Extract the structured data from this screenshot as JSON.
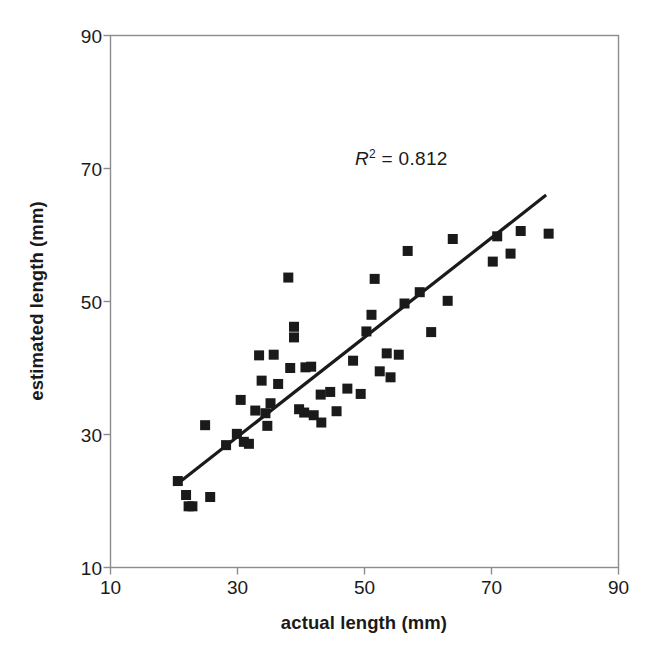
{
  "chart_data": {
    "type": "scatter",
    "title": "",
    "xlabel": "actual length (mm)",
    "ylabel": "estimated length (mm)",
    "xlim": [
      10,
      90
    ],
    "ylim": [
      10,
      90
    ],
    "xticks": [
      10,
      30,
      50,
      70,
      90
    ],
    "yticks": [
      10,
      30,
      50,
      70,
      90
    ],
    "grid": false,
    "legend": null,
    "annotations": [
      {
        "name": "r-squared",
        "text": "R2 = 0.812",
        "r_symbol": "R",
        "exponent": "2",
        "equals": " = ",
        "value": "0.812",
        "x": 50,
        "y": 69
      }
    ],
    "marker": {
      "shape": "square",
      "color": "#1a1a1a",
      "size_px": 10
    },
    "trendline": {
      "name": "linear-regression-line",
      "color": "#1a1a1a",
      "width_px": 3.2,
      "x_start": 20.7,
      "y_start": 22.7,
      "x_end": 78.6,
      "y_end": 66.0
    },
    "points": [
      {
        "x": 20.6,
        "y": 23.0
      },
      {
        "x": 21.9,
        "y": 20.9
      },
      {
        "x": 22.3,
        "y": 19.2
      },
      {
        "x": 22.9,
        "y": 19.2
      },
      {
        "x": 25.7,
        "y": 20.6
      },
      {
        "x": 24.9,
        "y": 31.4
      },
      {
        "x": 28.2,
        "y": 28.4
      },
      {
        "x": 29.9,
        "y": 30.1
      },
      {
        "x": 31.0,
        "y": 28.9
      },
      {
        "x": 31.8,
        "y": 28.6
      },
      {
        "x": 30.5,
        "y": 35.2
      },
      {
        "x": 32.8,
        "y": 33.6
      },
      {
        "x": 33.8,
        "y": 38.1
      },
      {
        "x": 34.7,
        "y": 31.3
      },
      {
        "x": 34.4,
        "y": 33.2
      },
      {
        "x": 35.2,
        "y": 34.7
      },
      {
        "x": 35.7,
        "y": 42.0
      },
      {
        "x": 36.4,
        "y": 37.6
      },
      {
        "x": 33.4,
        "y": 41.9
      },
      {
        "x": 38.0,
        "y": 53.6
      },
      {
        "x": 38.9,
        "y": 46.2
      },
      {
        "x": 38.9,
        "y": 44.6
      },
      {
        "x": 38.3,
        "y": 40.0
      },
      {
        "x": 39.7,
        "y": 33.8
      },
      {
        "x": 40.5,
        "y": 33.3
      },
      {
        "x": 40.7,
        "y": 40.1
      },
      {
        "x": 41.6,
        "y": 40.2
      },
      {
        "x": 42.0,
        "y": 32.9
      },
      {
        "x": 43.2,
        "y": 31.8
      },
      {
        "x": 43.1,
        "y": 36.0
      },
      {
        "x": 44.6,
        "y": 36.4
      },
      {
        "x": 45.6,
        "y": 33.5
      },
      {
        "x": 47.3,
        "y": 36.9
      },
      {
        "x": 48.2,
        "y": 41.1
      },
      {
        "x": 49.4,
        "y": 36.1
      },
      {
        "x": 50.3,
        "y": 45.5
      },
      {
        "x": 51.1,
        "y": 48.0
      },
      {
        "x": 51.6,
        "y": 53.4
      },
      {
        "x": 52.4,
        "y": 39.5
      },
      {
        "x": 53.5,
        "y": 42.2
      },
      {
        "x": 54.1,
        "y": 38.6
      },
      {
        "x": 55.4,
        "y": 42.0
      },
      {
        "x": 56.8,
        "y": 57.6
      },
      {
        "x": 56.3,
        "y": 49.7
      },
      {
        "x": 58.7,
        "y": 51.4
      },
      {
        "x": 60.5,
        "y": 45.4
      },
      {
        "x": 63.1,
        "y": 50.1
      },
      {
        "x": 63.9,
        "y": 59.4
      },
      {
        "x": 70.2,
        "y": 56.0
      },
      {
        "x": 70.9,
        "y": 59.8
      },
      {
        "x": 73.0,
        "y": 57.2
      },
      {
        "x": 74.6,
        "y": 60.6
      },
      {
        "x": 79.0,
        "y": 60.2
      }
    ]
  },
  "axes": {
    "frame_color": "#8c8c8c",
    "tick_color": "#8c8c8c",
    "x_tick_labels": [
      "10",
      "30",
      "50",
      "70",
      "90"
    ],
    "y_tick_labels": [
      "10",
      "30",
      "50",
      "70",
      "90"
    ]
  }
}
